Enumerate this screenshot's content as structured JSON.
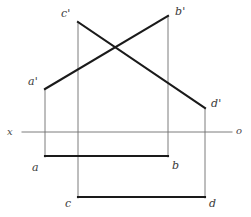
{
  "figure": {
    "background_color": "#ffffff",
    "stroke_color_heavy": "#1a1a1a",
    "stroke_color_light": "#6e6e6e",
    "label_color": "#3a3a3a",
    "width": 251,
    "height": 217
  },
  "axis": {
    "name": "ground-line",
    "left_label": "x",
    "right_label": "o",
    "y": 132,
    "x_start": 22,
    "x_end": 232,
    "left_label_pos": {
      "x": 7,
      "y": 127
    },
    "right_label_pos": {
      "x": 236,
      "y": 126
    }
  },
  "points": [
    {
      "id": "a_prime",
      "label": "a'",
      "x": 45,
      "y": 89,
      "label_pos": {
        "x": 28,
        "y": 76
      },
      "plane": "vertical"
    },
    {
      "id": "b_prime",
      "label": "b'",
      "x": 168,
      "y": 16,
      "label_pos": {
        "x": 175,
        "y": 6
      },
      "plane": "vertical"
    },
    {
      "id": "c_prime",
      "label": "c'",
      "x": 78,
      "y": 22,
      "label_pos": {
        "x": 61,
        "y": 8
      },
      "plane": "vertical"
    },
    {
      "id": "d_prime",
      "label": "d'",
      "x": 205,
      "y": 108,
      "label_pos": {
        "x": 211,
        "y": 98
      },
      "plane": "vertical"
    },
    {
      "id": "a",
      "label": "a",
      "x": 45,
      "y": 156,
      "label_pos": {
        "x": 32,
        "y": 162
      },
      "plane": "horizontal"
    },
    {
      "id": "b",
      "label": "b",
      "x": 168,
      "y": 156,
      "label_pos": {
        "x": 172,
        "y": 160
      },
      "plane": "horizontal"
    },
    {
      "id": "c",
      "label": "c",
      "x": 78,
      "y": 197,
      "label_pos": {
        "x": 65,
        "y": 198
      },
      "plane": "horizontal"
    },
    {
      "id": "d",
      "label": "d",
      "x": 205,
      "y": 197,
      "label_pos": {
        "x": 209,
        "y": 198
      },
      "plane": "horizontal"
    }
  ],
  "segments": [
    {
      "id": "ab-front-view",
      "name": "line-a-prime-b-prime",
      "x1": 45,
      "y1": 89,
      "x2": 168,
      "y2": 16,
      "weight": "heavy"
    },
    {
      "id": "cd-front-view",
      "name": "line-c-prime-d-prime",
      "x1": 78,
      "y1": 22,
      "x2": 205,
      "y2": 108,
      "weight": "heavy"
    },
    {
      "id": "ab-top-view",
      "name": "line-a-b",
      "x1": 45,
      "y1": 156,
      "x2": 168,
      "y2": 156,
      "weight": "heavy"
    },
    {
      "id": "cd-top-view",
      "name": "line-c-d",
      "x1": 78,
      "y1": 197,
      "x2": 205,
      "y2": 197,
      "weight": "heavy"
    }
  ],
  "projectors": [
    {
      "id": "proj-a",
      "name": "projector-a",
      "x": 45,
      "y1": 89,
      "y2": 157
    },
    {
      "id": "proj-b",
      "name": "projector-b",
      "x": 168,
      "y1": 16,
      "y2": 157
    },
    {
      "id": "proj-c",
      "name": "projector-c",
      "x": 78,
      "y1": 22,
      "y2": 198
    },
    {
      "id": "proj-d",
      "name": "projector-d",
      "x": 205,
      "y1": 108,
      "y2": 198
    }
  ],
  "intersection": {
    "name": "apparent-crossing-point",
    "x": 112,
    "y": 47
  }
}
